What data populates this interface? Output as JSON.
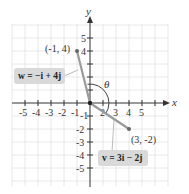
{
  "figure": {
    "x_axis_label": "x",
    "y_axis_label": "y",
    "x_ticks": [
      "-5",
      "-4",
      "-3",
      "-2",
      "-1",
      "2",
      "3",
      "4",
      "5"
    ],
    "y_ticks_pos": [
      "5",
      "4"
    ],
    "y_ticks_neg": [
      "-1",
      "-2",
      "-3",
      "-4",
      "-5"
    ],
    "angle_label": "θ",
    "point_w": {
      "label": "(-1, 4)",
      "x": -1,
      "y": 4
    },
    "point_v": {
      "label": "(3, -2)",
      "x": 3,
      "y": -2
    },
    "vector_w_label": "w = −i + 4j",
    "vector_v_label": "v = 3i − 2j"
  },
  "colors": {
    "grid": "#e0e0e0",
    "axis": "#333333",
    "vector": "#9a9a9a",
    "point": "#777777",
    "label_box": "#d9d9d9",
    "arc": "#444444"
  }
}
